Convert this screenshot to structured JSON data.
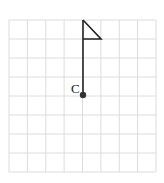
{
  "diagram": {
    "grid": {
      "columns": 8,
      "rows": 8,
      "color": "#d9d9d9"
    },
    "point": {
      "label": "C",
      "color": "#333333"
    },
    "flag": {
      "color": "#222222"
    }
  }
}
